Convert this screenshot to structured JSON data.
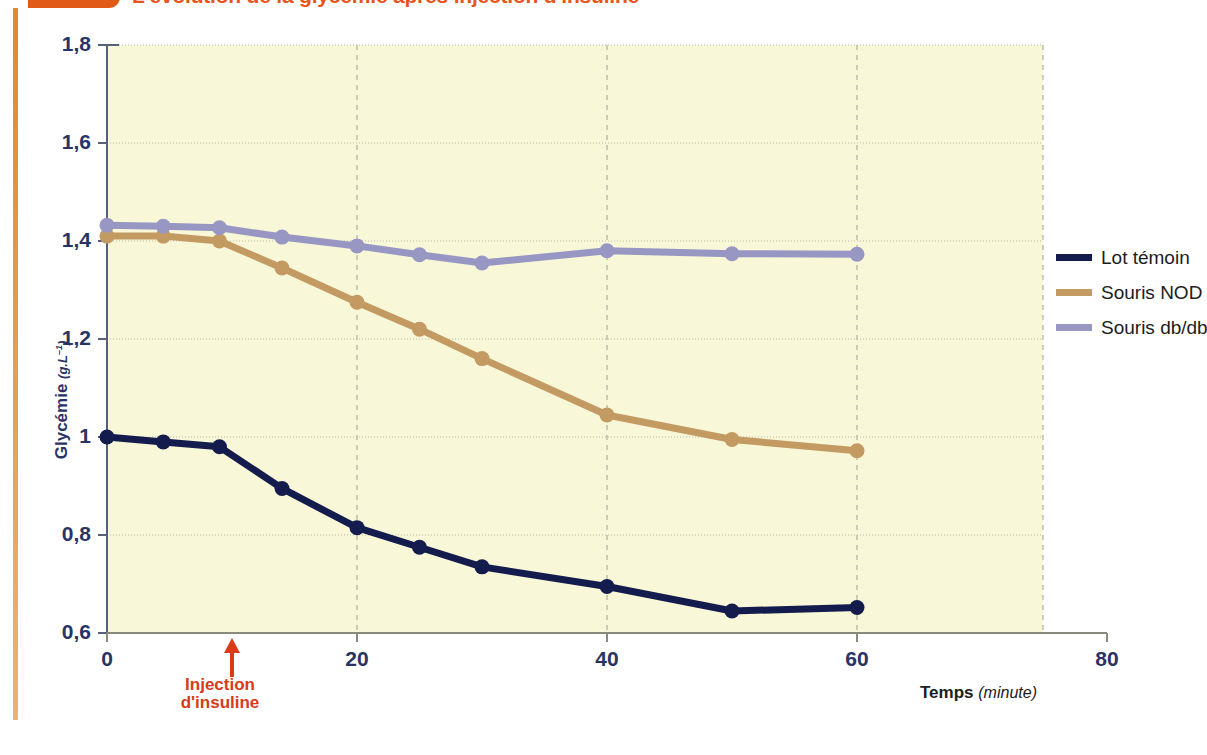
{
  "document": {
    "title": "L'évolution de la glycémie après injection d'insuline",
    "accent_orange": "#e8541b",
    "rail_orange": "#e8862a"
  },
  "axes": {
    "y_label_text": "Glycémie",
    "y_label_unit": "(g.L",
    "y_label_unit_sup": "–1",
    "y_label_unit_end": ")",
    "x_label_text": "Temps",
    "x_label_unit": "(minute)",
    "y_ticks": [
      "0,6",
      "0,8",
      "1",
      "1,2",
      "1,4",
      "1,6",
      "1,8"
    ],
    "x_ticks": [
      "0",
      "20",
      "40",
      "60",
      "80"
    ],
    "y_min": 0.6,
    "y_max": 1.8,
    "x_min": 0,
    "x_max": 80,
    "grid": true
  },
  "annotation": {
    "injection_line1": "Injection",
    "injection_line2": "d'insuline",
    "injection_time": 10,
    "injection_color": "#d93a18"
  },
  "legend": {
    "position": "right",
    "entries": [
      {
        "label": "Lot témoin",
        "color": "#141b4d"
      },
      {
        "label": "Souris NOD",
        "color": "#c49a63"
      },
      {
        "label": "Souris db/db",
        "color": "#9897c4"
      }
    ]
  },
  "chart_data": {
    "type": "line",
    "title": "L'évolution de la glycémie après injection d'insuline",
    "xlabel": "Temps (minute)",
    "ylabel": "Glycémie (g.L–1)",
    "xlim": [
      0,
      80
    ],
    "ylim": [
      0.6,
      1.8
    ],
    "x": [
      0,
      4.5,
      9,
      14,
      20,
      25,
      30,
      40,
      50,
      60
    ],
    "series": [
      {
        "name": "Lot témoin",
        "color": "#141b4d",
        "values": [
          1.0,
          0.99,
          0.98,
          0.895,
          0.815,
          0.775,
          0.735,
          0.695,
          0.645,
          0.652
        ]
      },
      {
        "name": "Souris NOD",
        "color": "#c49a63",
        "values": [
          1.41,
          1.41,
          1.4,
          1.345,
          1.275,
          1.22,
          1.16,
          1.045,
          0.995,
          0.972
        ]
      },
      {
        "name": "Souris db/db",
        "color": "#9897c4",
        "values": [
          1.432,
          1.43,
          1.427,
          1.408,
          1.39,
          1.372,
          1.355,
          1.38,
          1.374,
          1.373
        ]
      }
    ]
  }
}
